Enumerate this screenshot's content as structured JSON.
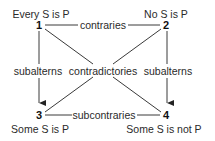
{
  "diagram": {
    "nodes": [
      {
        "id": "1",
        "label": "Every S is P"
      },
      {
        "id": "2",
        "label": "No S is P"
      },
      {
        "id": "3",
        "label": "Some S is P"
      },
      {
        "id": "4",
        "label": "Some S is not P"
      }
    ],
    "edges": {
      "top": {
        "from": "1",
        "to": "2",
        "label": "contraries"
      },
      "left": {
        "from": "1",
        "to": "3",
        "label": "subalterns",
        "arrow": true
      },
      "right": {
        "from": "2",
        "to": "4",
        "label": "subalterns",
        "arrow": true
      },
      "diagonals": {
        "label": "contradictories",
        "pairs": [
          [
            "1",
            "4"
          ],
          [
            "2",
            "3"
          ]
        ]
      },
      "bottom": {
        "from": "3",
        "to": "4",
        "label": "subcontraries"
      }
    }
  }
}
